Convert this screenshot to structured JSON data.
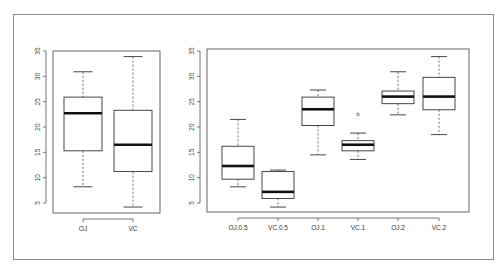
{
  "chart_data": [
    {
      "type": "box",
      "title": "",
      "xlabel": "",
      "ylabel": "",
      "ylim": [
        3,
        35.5
      ],
      "yticks": [
        5,
        10,
        15,
        20,
        25,
        30,
        35
      ],
      "categories": [
        "OJ",
        "VC"
      ],
      "boxes": [
        {
          "name": "OJ",
          "whisker_low": 8.2,
          "q1": 15.3,
          "median": 22.7,
          "q3": 25.9,
          "whisker_high": 30.9,
          "outliers": []
        },
        {
          "name": "VC",
          "whisker_low": 4.2,
          "q1": 11.2,
          "median": 16.5,
          "q3": 23.3,
          "whisker_high": 33.9,
          "outliers": []
        }
      ],
      "grid": false,
      "legend": null
    },
    {
      "type": "box",
      "title": "",
      "xlabel": "",
      "ylabel": "",
      "ylim": [
        3,
        35.5
      ],
      "yticks": [
        5,
        10,
        15,
        20,
        25,
        30,
        35
      ],
      "categories": [
        "OJ.0.5",
        "VC.0.5",
        "OJ.1",
        "VC.1",
        "OJ.2",
        "VC.2"
      ],
      "boxes": [
        {
          "name": "OJ.0.5",
          "whisker_low": 8.2,
          "q1": 9.7,
          "median": 12.3,
          "q3": 16.2,
          "whisker_high": 21.5,
          "outliers": []
        },
        {
          "name": "VC.0.5",
          "whisker_low": 4.2,
          "q1": 5.9,
          "median": 7.2,
          "q3": 11.2,
          "whisker_high": 11.5,
          "outliers": []
        },
        {
          "name": "OJ.1",
          "whisker_low": 14.5,
          "q1": 20.3,
          "median": 23.5,
          "q3": 25.9,
          "whisker_high": 27.3,
          "outliers": []
        },
        {
          "name": "VC.1",
          "whisker_low": 13.6,
          "q1": 15.3,
          "median": 16.5,
          "q3": 17.3,
          "whisker_high": 18.8,
          "outliers": [
            22.5
          ]
        },
        {
          "name": "OJ.2",
          "whisker_low": 22.4,
          "q1": 24.6,
          "median": 26.0,
          "q3": 27.1,
          "whisker_high": 30.9,
          "outliers": []
        },
        {
          "name": "VC.2",
          "whisker_low": 18.5,
          "q1": 23.4,
          "median": 26.0,
          "q3": 29.8,
          "whisker_high": 33.9,
          "outliers": []
        }
      ],
      "grid": false,
      "legend": null
    }
  ]
}
